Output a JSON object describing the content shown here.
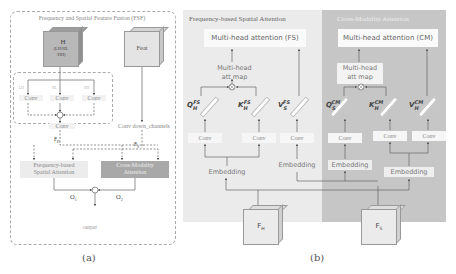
{
  "panel_a": {
    "title": "Frequency and Spatial Feature Fusion (FSF)",
    "input_h": {
      "label": "H",
      "sub1": "(LH/HL",
      "sub2": "/HH)"
    },
    "input_feat": {
      "label": "Feat"
    },
    "branch_labels": [
      "LH",
      "HL",
      "HH"
    ],
    "convs": [
      "Conv",
      "Conv",
      "Conv"
    ],
    "fused_conv": "Conv",
    "down_conv": "Conv down_channels",
    "fh_label": "F_H",
    "fs_label": "F_S",
    "fs_attention": {
      "line1": "Frequency-based",
      "line2": "Spatial Attention"
    },
    "cm_attention": {
      "line1": "Cross-Modality",
      "line2": "Attention"
    },
    "o1": "O",
    "o1_sub": "1",
    "o2": "O",
    "o2_sub": "2",
    "output": "output",
    "caption": "(a)"
  },
  "panel_b": {
    "fs": {
      "title": "Frequency-based Spatial Attention",
      "mha": "Multi-head attention (FS)",
      "attmap_line1": "Multi-head",
      "attmap_line2": "att map",
      "q": {
        "base": "Q",
        "sub": "H",
        "sup": "FS"
      },
      "k": {
        "base": "K",
        "sub": "H",
        "sup": "FS"
      },
      "v": {
        "base": "V",
        "sub": "S",
        "sup": "FS"
      },
      "convs": [
        "Conv",
        "Conv",
        "Conv"
      ],
      "embeddings": [
        "Embedding",
        "Embedding"
      ]
    },
    "cm": {
      "title": "Cross-Modality Attention",
      "mha": "Multi-head attention (CM)",
      "attmap_line1": "Multi-head",
      "attmap_line2": "att map",
      "q": {
        "base": "Q",
        "sub": "S",
        "sup": "CM"
      },
      "k": {
        "base": "K",
        "sub": "H",
        "sup": "CM"
      },
      "v": {
        "base": "V",
        "sub": "H",
        "sup": "CM"
      },
      "convs": [
        "Conv",
        "Conv",
        "Conv"
      ],
      "embeddings": [
        "Embedding",
        "Embedding"
      ]
    },
    "input_fh": {
      "base": "F",
      "sub": "H"
    },
    "input_fs": {
      "base": "F",
      "sub": "S"
    },
    "caption": "(b)"
  },
  "colors": {
    "fs_panel": "#ebebeb",
    "cm_panel": "#c6c6c6",
    "h_cube": "#b8b8b8",
    "feat_cube": "#e4e4e4",
    "fs_attention_box": "#ececec",
    "cm_attention_box": "#a8a8a8"
  }
}
